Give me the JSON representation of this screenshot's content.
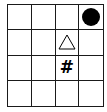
{
  "board": {
    "rows": 4,
    "cols": 4,
    "pieces": [
      {
        "row": 0,
        "col": 3,
        "type": "circle",
        "label": "",
        "color": "#000000"
      },
      {
        "row": 1,
        "col": 2,
        "type": "triangle",
        "label": "",
        "color": "#000000"
      },
      {
        "row": 2,
        "col": 2,
        "type": "hash",
        "label": "#",
        "color": "#000000"
      }
    ]
  }
}
